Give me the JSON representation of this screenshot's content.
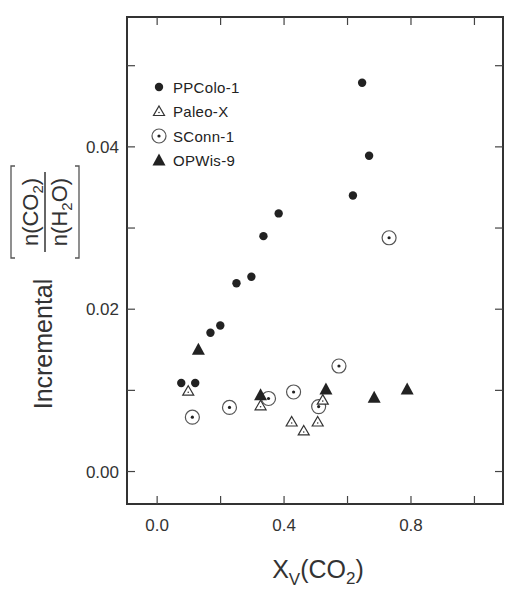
{
  "chart_data": {
    "type": "scatter",
    "title": "",
    "xlabel": "X_V(CO2)",
    "xlabel_parts": {
      "base": "X",
      "sub": "V",
      "rest_open": "(CO",
      "rest_sub": "2",
      "rest_close": ")"
    },
    "ylabel": "Incremental [n(CO2)/n(H2O)]",
    "ylabel_parts": {
      "word": "Incremental",
      "numerator": "n(CO2)",
      "denominator": "n(H2O)"
    },
    "xlim": [
      -0.095,
      1.09
    ],
    "ylim": [
      -0.004,
      0.056
    ],
    "x_ticks": [
      0.0,
      0.2,
      0.4,
      0.6,
      0.8,
      1.0
    ],
    "x_tick_labels": [
      {
        "value": 0.0,
        "label": "0.0"
      },
      {
        "value": 0.4,
        "label": "0.4"
      },
      {
        "value": 0.8,
        "label": "0.8"
      }
    ],
    "y_ticks": [
      0.0,
      0.01,
      0.02,
      0.03,
      0.04,
      0.05
    ],
    "y_tick_labels": [
      {
        "value": 0.0,
        "label": "0.00"
      },
      {
        "value": 0.02,
        "label": "0.02"
      },
      {
        "value": 0.04,
        "label": "0.04"
      }
    ],
    "grid": false,
    "legend_position": "upper left",
    "series": [
      {
        "name": "PPColo-1",
        "marker": "filled-circle",
        "points": [
          [
            0.076,
            0.0109
          ],
          [
            0.12,
            0.0109
          ],
          [
            0.168,
            0.0171
          ],
          [
            0.199,
            0.018
          ],
          [
            0.25,
            0.0232
          ],
          [
            0.297,
            0.024
          ],
          [
            0.335,
            0.029
          ],
          [
            0.383,
            0.0318
          ],
          [
            0.617,
            0.034
          ],
          [
            0.668,
            0.0389
          ],
          [
            0.646,
            0.0479
          ]
        ]
      },
      {
        "name": "Paleo-X",
        "marker": "open-triangle",
        "points": [
          [
            0.098,
            0.0099
          ],
          [
            0.326,
            0.0081
          ],
          [
            0.424,
            0.0061
          ],
          [
            0.462,
            0.005
          ],
          [
            0.506,
            0.0061
          ],
          [
            0.522,
            0.0088
          ]
        ]
      },
      {
        "name": "SConn-1",
        "marker": "dotted-circle",
        "points": [
          [
            0.111,
            0.0067
          ],
          [
            0.228,
            0.0079
          ],
          [
            0.351,
            0.009
          ],
          [
            0.43,
            0.0098
          ],
          [
            0.509,
            0.008
          ],
          [
            0.573,
            0.013
          ],
          [
            0.731,
            0.0288
          ]
        ]
      },
      {
        "name": "OPWis-9",
        "marker": "filled-triangle",
        "points": [
          [
            0.13,
            0.015
          ],
          [
            0.326,
            0.0094
          ],
          [
            0.532,
            0.0101
          ],
          [
            0.684,
            0.0091
          ],
          [
            0.788,
            0.0101
          ]
        ]
      }
    ]
  },
  "legend": {
    "items": [
      {
        "label": "PPColo-1",
        "marker": "filled-circle"
      },
      {
        "label": "Paleo-X",
        "marker": "open-triangle"
      },
      {
        "label": "SConn-1",
        "marker": "dotted-circle"
      },
      {
        "label": "OPWis-9",
        "marker": "filled-triangle"
      }
    ]
  },
  "colors": {
    "ink": "#222222",
    "frame": "#333333",
    "background": "#ffffff"
  }
}
